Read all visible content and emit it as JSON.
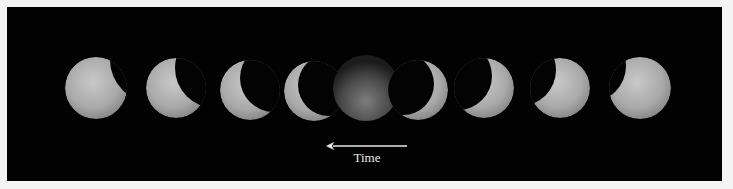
{
  "figure": {
    "background_color": "#020202",
    "moon_color": "#bdbdbd",
    "moons": [
      {
        "phase": "partial-eclipse-shadow-right",
        "index": 1
      },
      {
        "phase": "partial-eclipse-larger-shadow-right",
        "index": 2
      },
      {
        "phase": "crescent-left",
        "index": 3
      },
      {
        "phase": "thin-crescent-left",
        "index": 4
      },
      {
        "phase": "totality",
        "index": 5
      },
      {
        "phase": "thin-crescent-right",
        "index": 6
      },
      {
        "phase": "crescent-right",
        "index": 7
      },
      {
        "phase": "partial-eclipse-shadow-left",
        "index": 8
      },
      {
        "phase": "partial-eclipse-small-shadow-left",
        "index": 9
      }
    ],
    "arrow": {
      "direction": "left",
      "icon": "arrow-left-icon"
    },
    "label": "Time"
  }
}
